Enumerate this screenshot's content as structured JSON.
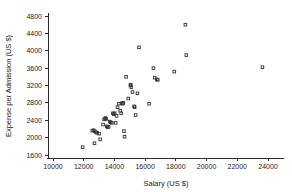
{
  "chart_data": {
    "type": "scatter",
    "title": "",
    "xlabel": "Salary (US $)",
    "ylabel": "Expense per Admission (US $)",
    "xlim": [
      9500,
      24800
    ],
    "ylim": [
      1500,
      4950
    ],
    "xticks": [
      10000,
      12000,
      14000,
      16000,
      18000,
      20000,
      22000,
      24000
    ],
    "yticks": [
      1600,
      2000,
      2400,
      2800,
      3200,
      3600,
      4000,
      4400,
      4800
    ],
    "xtick_labels": [
      "10000",
      "12000",
      "14000",
      "16000",
      "18000",
      "20000",
      "22000",
      "24000"
    ],
    "ytick_labels": [
      "1600",
      "2000",
      "2400",
      "2800",
      "3200",
      "3600",
      "4000",
      "4400",
      "4800"
    ],
    "grid": false,
    "legend": null,
    "marker": "open-square",
    "marker_color": "#333333",
    "background_color": "#ffffff",
    "points": [
      {
        "x": 11930,
        "y": 1780
      },
      {
        "x": 12700,
        "y": 1870
      },
      {
        "x": 12560,
        "y": 2160
      },
      {
        "x": 12640,
        "y": 2170
      },
      {
        "x": 12720,
        "y": 2150
      },
      {
        "x": 12800,
        "y": 2120
      },
      {
        "x": 12880,
        "y": 2110
      },
      {
        "x": 13000,
        "y": 2090
      },
      {
        "x": 13070,
        "y": 1960
      },
      {
        "x": 13260,
        "y": 2300
      },
      {
        "x": 13330,
        "y": 2420
      },
      {
        "x": 13400,
        "y": 2440
      },
      {
        "x": 13420,
        "y": 2450
      },
      {
        "x": 13460,
        "y": 2430
      },
      {
        "x": 13500,
        "y": 2260
      },
      {
        "x": 13560,
        "y": 2240
      },
      {
        "x": 13620,
        "y": 2250
      },
      {
        "x": 13700,
        "y": 2370
      },
      {
        "x": 13760,
        "y": 2350
      },
      {
        "x": 13830,
        "y": 2340
      },
      {
        "x": 13900,
        "y": 2560
      },
      {
        "x": 13960,
        "y": 2540
      },
      {
        "x": 14020,
        "y": 2560
      },
      {
        "x": 14080,
        "y": 2340
      },
      {
        "x": 14140,
        "y": 2500
      },
      {
        "x": 14200,
        "y": 2700
      },
      {
        "x": 14280,
        "y": 2780
      },
      {
        "x": 14380,
        "y": 2620
      },
      {
        "x": 14440,
        "y": 2560
      },
      {
        "x": 14480,
        "y": 2790
      },
      {
        "x": 14540,
        "y": 2780
      },
      {
        "x": 14580,
        "y": 2800
      },
      {
        "x": 14620,
        "y": 2150
      },
      {
        "x": 14660,
        "y": 2020
      },
      {
        "x": 14760,
        "y": 3400
      },
      {
        "x": 14900,
        "y": 2900
      },
      {
        "x": 15040,
        "y": 3200
      },
      {
        "x": 15060,
        "y": 3220
      },
      {
        "x": 15100,
        "y": 3160
      },
      {
        "x": 15180,
        "y": 3050
      },
      {
        "x": 15280,
        "y": 2720
      },
      {
        "x": 15320,
        "y": 2700
      },
      {
        "x": 15380,
        "y": 2520
      },
      {
        "x": 15500,
        "y": 3020
      },
      {
        "x": 15600,
        "y": 4080
      },
      {
        "x": 16260,
        "y": 2780
      },
      {
        "x": 16540,
        "y": 3600
      },
      {
        "x": 16620,
        "y": 3380
      },
      {
        "x": 16760,
        "y": 3340
      },
      {
        "x": 16820,
        "y": 3330
      },
      {
        "x": 17900,
        "y": 3520
      },
      {
        "x": 18620,
        "y": 4600
      },
      {
        "x": 18680,
        "y": 3900
      },
      {
        "x": 23640,
        "y": 3620
      }
    ]
  }
}
